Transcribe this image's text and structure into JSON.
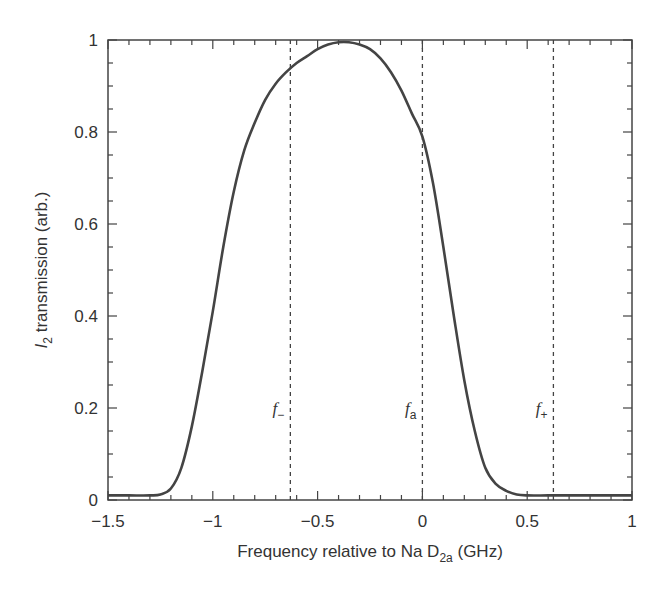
{
  "chart_data": {
    "type": "line",
    "title": "",
    "xlabel": "Frequency relative to Na D2a (GHz)",
    "xlabel_parts": {
      "main": "Frequency relative to Na D",
      "sub": "2a",
      "tail": " (GHz)"
    },
    "ylabel": "I2 transmission (arb.)",
    "ylabel_parts": {
      "italic": "I",
      "sub": "2",
      "tail": " transmission (arb.)"
    },
    "xlim": [
      -1.5,
      1
    ],
    "ylim": [
      0,
      1
    ],
    "xticks": [
      -1.5,
      -1,
      -0.5,
      0,
      0.5,
      1
    ],
    "xtick_labels": [
      "−1.5",
      "−1",
      "−0.5",
      "0",
      "0.5",
      "1"
    ],
    "yticks": [
      0,
      0.2,
      0.4,
      0.6,
      0.8,
      1
    ],
    "ytick_labels": [
      "0",
      "0.2",
      "0.4",
      "0.6",
      "0.8",
      "1"
    ],
    "x_minor_step": 0.1,
    "y_minor_step": 0.05,
    "grid": false,
    "legend": null,
    "series": [
      {
        "name": "I2 transmission",
        "color": "#444444",
        "x": [
          -1.5,
          -1.4,
          -1.3,
          -1.25,
          -1.2,
          -1.15,
          -1.1,
          -1.05,
          -1.0,
          -0.95,
          -0.9,
          -0.85,
          -0.8,
          -0.75,
          -0.7,
          -0.65,
          -0.6,
          -0.55,
          -0.5,
          -0.45,
          -0.4,
          -0.35,
          -0.3,
          -0.25,
          -0.2,
          -0.15,
          -0.1,
          -0.05,
          0.0,
          0.05,
          0.1,
          0.15,
          0.2,
          0.25,
          0.3,
          0.35,
          0.4,
          0.45,
          0.5,
          0.6,
          0.7,
          0.8,
          0.9,
          1.0
        ],
        "values": [
          0.01,
          0.01,
          0.01,
          0.012,
          0.025,
          0.07,
          0.16,
          0.28,
          0.41,
          0.55,
          0.67,
          0.76,
          0.82,
          0.87,
          0.905,
          0.93,
          0.95,
          0.965,
          0.98,
          0.99,
          0.995,
          0.995,
          0.99,
          0.98,
          0.96,
          0.93,
          0.89,
          0.84,
          0.79,
          0.69,
          0.55,
          0.4,
          0.26,
          0.15,
          0.07,
          0.035,
          0.02,
          0.012,
          0.01,
          0.01,
          0.01,
          0.01,
          0.01,
          0.01
        ]
      }
    ],
    "annotations": [
      {
        "name": "f-minus",
        "x": -0.63,
        "label": "f",
        "subscript": "−",
        "label_y": 0.2,
        "style": "dashed"
      },
      {
        "name": "f-a",
        "x": 0.0,
        "label": "f",
        "subscript": "a",
        "label_y": 0.2,
        "style": "dashed"
      },
      {
        "name": "f-plus",
        "x": 0.625,
        "label": "f",
        "subscript": "+",
        "label_y": 0.2,
        "style": "dashed"
      }
    ]
  }
}
